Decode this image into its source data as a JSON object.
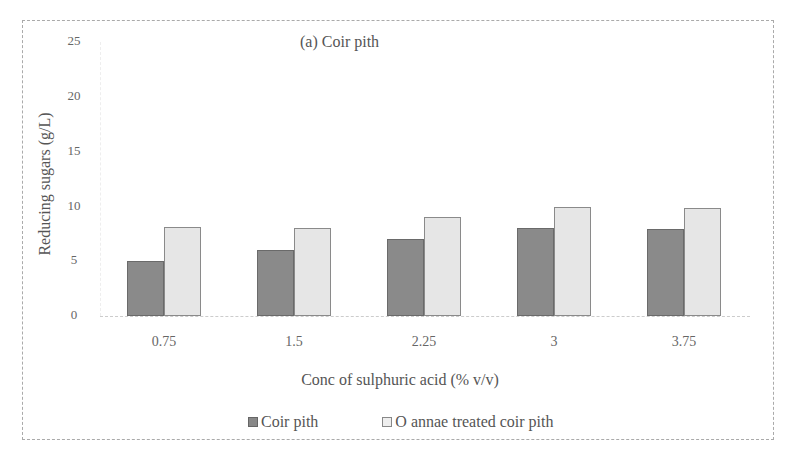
{
  "chart_data": {
    "type": "bar",
    "title": "(a) Coir pith",
    "xlabel": "Conc of sulphuric acid (% v/v)",
    "ylabel": "Reducing sugars (g/L)",
    "categories": [
      "0.75",
      "1.5",
      "2.25",
      "3",
      "3.75"
    ],
    "series": [
      {
        "name": "Coir pith",
        "values": [
          5.0,
          6.0,
          7.0,
          8.0,
          7.9
        ],
        "color": "#8a8a8a"
      },
      {
        "name": "O annae treated coir pith",
        "values": [
          8.1,
          8.0,
          9.0,
          10.0,
          9.9
        ],
        "color": "#e6e6e6"
      }
    ],
    "ylim": [
      0,
      25
    ],
    "yticks": [
      "0",
      "5",
      "10",
      "15",
      "20",
      "25"
    ],
    "grid": false,
    "legend_position": "bottom"
  },
  "labels": {
    "title": "(a) Coir pith",
    "xlabel": "Conc of sulphuric acid (% v/v)",
    "ylabel": "Reducing sugars (g/L)",
    "legend": [
      "Coir pith",
      "O annae treated coir pith"
    ]
  }
}
